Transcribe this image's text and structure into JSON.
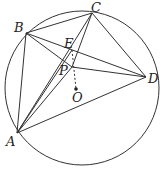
{
  "diagram": {
    "type": "geometry",
    "circle": {
      "center_label": "O",
      "cx": 82,
      "cy": 88,
      "r": 77
    },
    "points": {
      "A": {
        "label": "A",
        "x": 17,
        "y": 133,
        "lx": 6,
        "ly": 146
      },
      "B": {
        "label": "B",
        "x": 26,
        "y": 33,
        "lx": 14,
        "ly": 32
      },
      "C": {
        "label": "C",
        "x": 92,
        "y": 13,
        "lx": 91,
        "ly": 12
      },
      "D": {
        "label": "D",
        "x": 146,
        "y": 77,
        "lx": 148,
        "ly": 83
      },
      "E": {
        "label": "E",
        "x": 72,
        "y": 50,
        "lx": 64,
        "ly": 48
      },
      "P": {
        "label": "P",
        "x": 72,
        "y": 67,
        "lx": 59,
        "ly": 75
      },
      "O": {
        "label": "O",
        "x": 76,
        "y": 89,
        "lx": 72,
        "ly": 102
      }
    },
    "solid_segments": [
      [
        "A",
        "B"
      ],
      [
        "B",
        "C"
      ],
      [
        "C",
        "D"
      ],
      [
        "D",
        "A"
      ],
      [
        "A",
        "C"
      ],
      [
        "B",
        "D"
      ],
      [
        "A",
        "E"
      ],
      [
        "B",
        "P"
      ],
      [
        "P",
        "D"
      ],
      [
        "C",
        "P"
      ],
      [
        "A",
        "P"
      ]
    ],
    "dashed_segments": [
      [
        "E",
        "O"
      ]
    ]
  }
}
